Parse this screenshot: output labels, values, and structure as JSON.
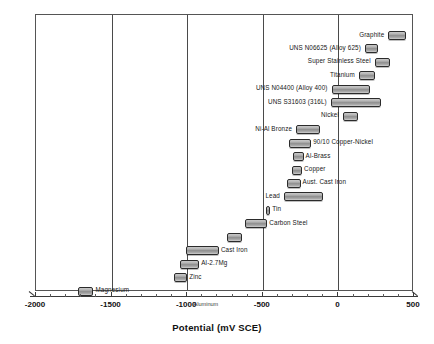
{
  "chart_data": {
    "type": "bar",
    "orientation": "horizontal-range",
    "title": "",
    "xlabel": "Potential (mV SCE)",
    "ylabel": "",
    "xlim": [
      -2000,
      500
    ],
    "xticks": [
      -2000,
      -1500,
      -1000,
      -500,
      0,
      500
    ],
    "xticklabels": [
      "-2000",
      "-1500",
      "-1000",
      "-500",
      "0",
      "500"
    ],
    "minor_tick_step": 100,
    "grid": "vertical-major",
    "legend": "none",
    "annotations": [
      {
        "text": "Aluminum",
        "x": -870,
        "position": "on-axis"
      }
    ],
    "bars": [
      {
        "label": "Graphite",
        "min": 330,
        "max": 450,
        "label_side": "left"
      },
      {
        "label": "UNS N06625 (Alloy 625)",
        "min": 175,
        "max": 260,
        "label_side": "left"
      },
      {
        "label": "Super Stainless Steel",
        "min": 240,
        "max": 340,
        "label_side": "left"
      },
      {
        "label": "Titanium",
        "min": 135,
        "max": 240,
        "label_side": "left"
      },
      {
        "label": "UNS N04400 (Alloy 400)",
        "min": -45,
        "max": 210,
        "label_side": "left"
      },
      {
        "label": "UNS S31603 (316L)",
        "min": -50,
        "max": 280,
        "label_side": "left"
      },
      {
        "label": "Nickel",
        "min": 30,
        "max": 130,
        "label_side": "left"
      },
      {
        "label": "Ni-Al Bronze",
        "min": -280,
        "max": -120,
        "label_side": "left"
      },
      {
        "label": "90/10 Copper-Nickel",
        "min": -330,
        "max": -180,
        "label_side": "right"
      },
      {
        "label": "Al-Brass",
        "min": -300,
        "max": -230,
        "label_side": "right"
      },
      {
        "label": "Copper",
        "min": -310,
        "max": -240,
        "label_side": "right"
      },
      {
        "label": "Aust. Cast Iron",
        "min": -340,
        "max": -250,
        "label_side": "right"
      },
      {
        "label": "Lead",
        "min": -360,
        "max": -100,
        "label_side": "left"
      },
      {
        "label": "Tin",
        "min": -480,
        "max": -450,
        "label_side": "right"
      },
      {
        "label": "Carbon Steel",
        "min": -620,
        "max": -470,
        "label_side": "right"
      },
      {
        "label": "",
        "min": -740,
        "max": -640,
        "label_side": "right"
      },
      {
        "label": "Cast Iron",
        "min": -1010,
        "max": -790,
        "label_side": "right"
      },
      {
        "label": "Al-2.7Mg",
        "min": -1050,
        "max": -920,
        "label_side": "right"
      },
      {
        "label": "Zinc",
        "min": -1090,
        "max": -1000,
        "label_side": "right"
      },
      {
        "label": "Magnesium",
        "min": -1720,
        "max": -1620,
        "label_side": "right"
      }
    ]
  },
  "axis": {
    "title": "Potential (mV SCE)",
    "aluminum_annotation": "Aluminum"
  }
}
